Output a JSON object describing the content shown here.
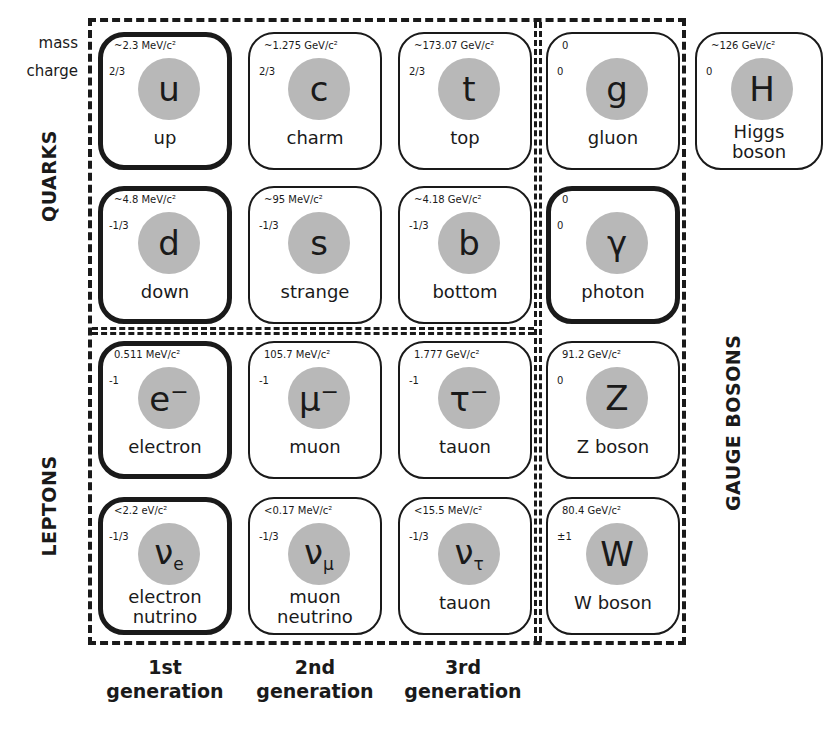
{
  "legend": {
    "mass_label": "mass",
    "charge_label": "charge"
  },
  "groups": {
    "quarks": "QUARKS",
    "leptons": "LEPTONS",
    "gauge_bosons": "GAUGE BOSONS"
  },
  "generations": [
    {
      "ordinal": "1st",
      "word": "generation"
    },
    {
      "ordinal": "2nd",
      "word": "generation"
    },
    {
      "ordinal": "3rd",
      "word": "generation"
    }
  ],
  "particles": {
    "up": {
      "mass": "~2.3 MeV/c²",
      "charge": "2/3",
      "symbol": "u",
      "sub": "",
      "sup": "",
      "name": "up"
    },
    "charm": {
      "mass": "~1.275 GeV/c²",
      "charge": "2/3",
      "symbol": "c",
      "sub": "",
      "sup": "",
      "name": "charm"
    },
    "top": {
      "mass": "~173.07 GeV/c²",
      "charge": "2/3",
      "symbol": "t",
      "sub": "",
      "sup": "",
      "name": "top"
    },
    "gluon": {
      "mass": "0",
      "charge": "0",
      "symbol": "g",
      "sub": "",
      "sup": "",
      "name": "gluon"
    },
    "higgs": {
      "mass": "~126 GeV/c²",
      "charge": "0",
      "symbol": "H",
      "sub": "",
      "sup": "",
      "name": "Higgs boson"
    },
    "down": {
      "mass": "~4.8 MeV/c²",
      "charge": "-1/3",
      "symbol": "d",
      "sub": "",
      "sup": "",
      "name": "down"
    },
    "strange": {
      "mass": "~95 MeV/c²",
      "charge": "-1/3",
      "symbol": "s",
      "sub": "",
      "sup": "",
      "name": "strange"
    },
    "bottom": {
      "mass": "~4.18 GeV/c²",
      "charge": "-1/3",
      "symbol": "b",
      "sub": "",
      "sup": "",
      "name": "bottom"
    },
    "photon": {
      "mass": "0",
      "charge": "0",
      "symbol": "γ",
      "sub": "",
      "sup": "",
      "name": "photon"
    },
    "electron": {
      "mass": "0.511 MeV/c²",
      "charge": "-1",
      "symbol": "e",
      "sub": "",
      "sup": "−",
      "name": "electron"
    },
    "muon": {
      "mass": "105.7 MeV/c²",
      "charge": "-1",
      "symbol": "μ",
      "sub": "",
      "sup": "−",
      "name": "muon"
    },
    "tauon": {
      "mass": "1.777 GeV/c²",
      "charge": "-1",
      "symbol": "τ",
      "sub": "",
      "sup": "−",
      "name": "tauon"
    },
    "z_boson": {
      "mass": "91.2 GeV/c²",
      "charge": "0",
      "symbol": "Z",
      "sub": "",
      "sup": "",
      "name": "Z boson"
    },
    "electron_neutrino": {
      "mass": "<2.2 eV/c²",
      "charge": "-1/3",
      "symbol": "ν",
      "sub": "e",
      "sup": "",
      "name": "electron nutrino"
    },
    "muon_neutrino": {
      "mass": "<0.17 MeV/c²",
      "charge": "-1/3",
      "symbol": "ν",
      "sub": "μ",
      "sup": "",
      "name": "muon neutrino"
    },
    "tau_neutrino": {
      "mass": "<15.5 MeV/c²",
      "charge": "-1/3",
      "symbol": "ν",
      "sub": "τ",
      "sup": "",
      "name": "tauon"
    },
    "w_boson": {
      "mass": "80.4 GeV/c²",
      "charge": "±1",
      "symbol": "W",
      "sub": "",
      "sup": "",
      "name": "W boson"
    }
  },
  "colors": {
    "ink": "#1a1a1a",
    "ball": "#b8b8b8",
    "background": "#ffffff"
  }
}
